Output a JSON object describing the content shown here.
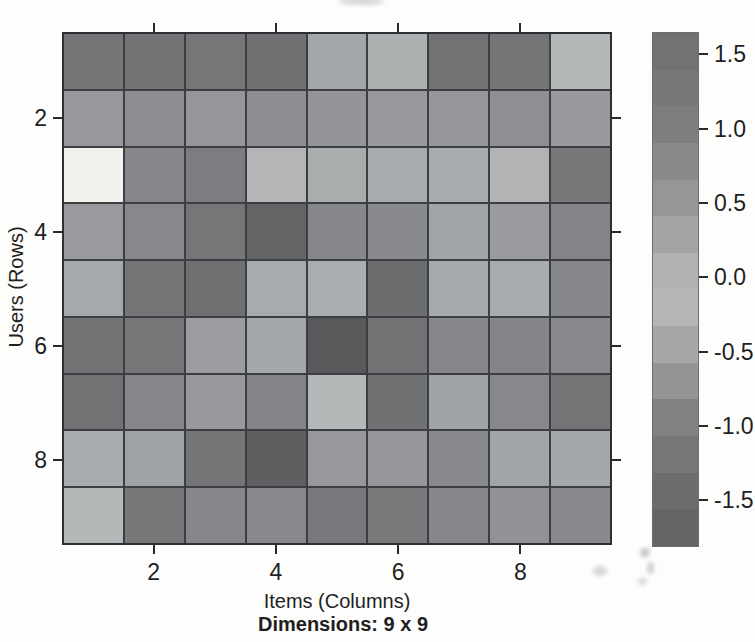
{
  "figure": {
    "background": "#fdfdfb",
    "grid_line_color": "#3c3e41",
    "border_color": "#2d2f32"
  },
  "chart_data": {
    "type": "heatmap",
    "title": "",
    "xlabel": "Items (Columns)",
    "ylabel": "Users (Rows)",
    "caption": "Dimensions: 9 x 9",
    "n_rows": 9,
    "n_cols": 9,
    "x_tick_values": [
      2,
      4,
      6,
      8
    ],
    "x_tick_labels": [
      "2",
      "4",
      "6",
      "8"
    ],
    "y_tick_values": [
      2,
      4,
      6,
      8
    ],
    "y_tick_labels": [
      "2",
      "4",
      "6",
      "8"
    ],
    "legend_position": "right",
    "colorbar": {
      "tick_values": [
        1.5,
        1.0,
        0.5,
        0.0,
        -0.5,
        -1.0,
        -1.5
      ],
      "tick_labels": [
        "1.5",
        "1.0",
        "0.5",
        "0.0",
        "-0.5",
        "-1.0",
        "-1.5"
      ],
      "value_range": [
        -1.8,
        1.65
      ],
      "n_bands": 14,
      "gradient_stops": [
        {
          "v": 1.65,
          "color": "#6d6f71"
        },
        {
          "v": 1.0,
          "color": "#7d7f81"
        },
        {
          "v": 0.5,
          "color": "#96989a"
        },
        {
          "v": 0.1,
          "color": "#aeb0b1"
        },
        {
          "v": -0.15,
          "color": "#b7b9ba"
        },
        {
          "v": -0.5,
          "color": "#a2a4a6"
        },
        {
          "v": -1.0,
          "color": "#7b7d7f"
        },
        {
          "v": -1.5,
          "color": "#67696b"
        },
        {
          "v": -1.8,
          "color": "#606264"
        }
      ]
    },
    "cell_colors": [
      [
        "#737577",
        "#717375",
        "#747678",
        "#6f7173",
        "#a4a7a9",
        "#adb0b1",
        "#707274",
        "#737577",
        "#b4b7b8"
      ],
      [
        "#96989b",
        "#8b8d90",
        "#949699",
        "#8c8e91",
        "#939598",
        "#97999c",
        "#95979a",
        "#8d8f92",
        "#97999c"
      ],
      [
        "#f2f1ee",
        "#85878a",
        "#7b7d80",
        "#b3b5b6",
        "#aaadae",
        "#a8abad",
        "#a9acae",
        "#b1b3b5",
        "#767879"
      ],
      [
        "#989a9d",
        "#86888b",
        "#747678",
        "#626466",
        "#85878a",
        "#888a8d",
        "#a2a5a7",
        "#999b9e",
        "#828487"
      ],
      [
        "#a6a9ab",
        "#737577",
        "#6e7072",
        "#a8abad",
        "#abaeb0",
        "#6a6c6e",
        "#a7aaac",
        "#a9acae",
        "#85878a"
      ],
      [
        "#717375",
        "#747678",
        "#9b9da0",
        "#a5a8aa",
        "#57595b",
        "#707274",
        "#85878a",
        "#838588",
        "#87898c"
      ],
      [
        "#707274",
        "#85878a",
        "#97999c",
        "#828487",
        "#b5b8b9",
        "#6f7173",
        "#a0a3a5",
        "#86888b",
        "#727476"
      ],
      [
        "#a9acae",
        "#9fa2a4",
        "#737577",
        "#5d5f61",
        "#96989b",
        "#95979a",
        "#888a8d",
        "#a2a5a7",
        "#a5a8aa"
      ],
      [
        "#b5b8b9",
        "#76787a",
        "#85878a",
        "#86888b",
        "#78797c",
        "#77797b",
        "#85878a",
        "#909295",
        "#87898c"
      ]
    ],
    "values_estimated": [
      [
        1.2,
        1.25,
        1.2,
        1.3,
        0.4,
        0.3,
        1.25,
        1.2,
        0.05
      ],
      [
        0.6,
        0.8,
        0.65,
        0.8,
        0.65,
        0.6,
        0.6,
        0.8,
        0.6
      ],
      [
        null,
        0.9,
        1.05,
        0.1,
        0.3,
        0.35,
        0.35,
        0.15,
        1.1
      ],
      [
        0.6,
        0.85,
        1.2,
        1.45,
        0.9,
        0.85,
        0.45,
        0.6,
        0.95
      ],
      [
        0.4,
        1.2,
        1.3,
        0.35,
        0.3,
        1.35,
        0.35,
        0.35,
        0.9
      ],
      [
        1.25,
        1.2,
        0.55,
        0.4,
        1.7,
        1.25,
        0.9,
        0.9,
        0.85
      ],
      [
        1.25,
        0.9,
        0.6,
        0.95,
        0.0,
        1.3,
        0.45,
        0.85,
        1.2
      ],
      [
        0.35,
        0.5,
        1.2,
        1.6,
        0.6,
        0.6,
        0.85,
        0.45,
        0.4
      ],
      [
        0.0,
        1.1,
        0.9,
        0.85,
        1.05,
        1.1,
        0.9,
        0.7,
        0.85
      ]
    ]
  }
}
